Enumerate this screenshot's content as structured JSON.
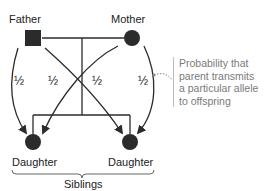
{
  "diagram": {
    "nodes": {
      "father": {
        "label": "Father",
        "shape": "square"
      },
      "mother": {
        "label": "Mother",
        "shape": "circle"
      },
      "daughter_left": {
        "label": "Daughter",
        "shape": "circle"
      },
      "daughter_right": {
        "label": "Daughter",
        "shape": "circle"
      }
    },
    "probabilities": [
      "½",
      "½",
      "½",
      "½"
    ],
    "group_label": "Siblings",
    "annotation": {
      "lines": [
        "Probability that",
        "parent transmits",
        "a particular allele",
        "to offspring"
      ]
    },
    "colors": {
      "node_fill": "#2b2b2b",
      "line": "#2b2b2b",
      "annotation_text": "#7a7a7a"
    }
  }
}
